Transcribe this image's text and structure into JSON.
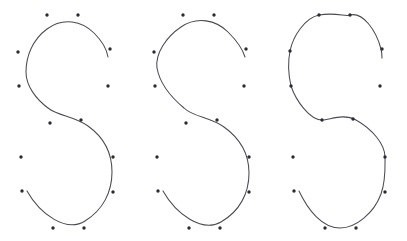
{
  "figure": {
    "title": "",
    "background_color": "#ffffff",
    "width": 407,
    "height": 241,
    "curve_color": "#4a4a52",
    "point_color": "#2b2b33",
    "point_radius": 1.7,
    "stroke_width": 1.05
  },
  "chart_data": {
    "type": "line",
    "title": "",
    "subtitle": "",
    "xlabel": "",
    "ylabel": "",
    "grid": false,
    "legend": "none",
    "xlim": [
      0,
      407
    ],
    "ylim": [
      241,
      0
    ],
    "panels": [
      {
        "name": "panel-1-approximating",
        "label": "approximating",
        "x_offset": 0,
        "control_points": [
          {
            "x": 47,
            "y": 15
          },
          {
            "x": 78,
            "y": 15
          },
          {
            "x": 18,
            "y": 52
          },
          {
            "x": 110,
            "y": 49
          },
          {
            "x": 19,
            "y": 86
          },
          {
            "x": 108,
            "y": 86
          },
          {
            "x": 50,
            "y": 123
          },
          {
            "x": 81,
            "y": 120
          },
          {
            "x": 21,
            "y": 157
          },
          {
            "x": 113,
            "y": 157
          },
          {
            "x": 22,
            "y": 191
          },
          {
            "x": 113,
            "y": 192
          },
          {
            "x": 53,
            "y": 228
          },
          {
            "x": 84,
            "y": 228
          }
        ],
        "path": "M 27 191 C 40 214 66 233 85 221 C 103 210 112 192 112 172 C 112 151 102 136 88 126 C 74 116 58 116 48 108 C 36 99 26 86 26 72 C 26 57 32 40 47 29 C 63 17 82 21 94 33 C 103 42 107 50 108 57"
      },
      {
        "name": "panel-2-intermediate",
        "label": "intermediate",
        "x_offset": 136,
        "control_points": [
          {
            "x": 183,
            "y": 15
          },
          {
            "x": 214,
            "y": 15
          },
          {
            "x": 154,
            "y": 52
          },
          {
            "x": 246,
            "y": 49
          },
          {
            "x": 155,
            "y": 86
          },
          {
            "x": 244,
            "y": 86
          },
          {
            "x": 186,
            "y": 123
          },
          {
            "x": 217,
            "y": 120
          },
          {
            "x": 157,
            "y": 157
          },
          {
            "x": 249,
            "y": 157
          },
          {
            "x": 158,
            "y": 191
          },
          {
            "x": 249,
            "y": 192
          },
          {
            "x": 189,
            "y": 228
          },
          {
            "x": 220,
            "y": 228
          }
        ],
        "path": "M 163 191 C 176 214 202 233 221 222 C 240 211 249 193 249 173 C 249 152 238 137 224 127 C 210 117 193 117 184 108 C 172 98 160 85 157 68 C 155 54 166 37 181 27 C 197 16 216 20 228 32 C 238 42 243 50 245 57"
      },
      {
        "name": "panel-3-interpolating",
        "label": "interpolating",
        "x_offset": 272,
        "control_points": [
          {
            "x": 319,
            "y": 15
          },
          {
            "x": 350,
            "y": 15
          },
          {
            "x": 290,
            "y": 51
          },
          {
            "x": 382,
            "y": 49
          },
          {
            "x": 291,
            "y": 86
          },
          {
            "x": 380,
            "y": 86
          },
          {
            "x": 322,
            "y": 120
          },
          {
            "x": 353,
            "y": 119
          },
          {
            "x": 293,
            "y": 157
          },
          {
            "x": 385,
            "y": 157
          },
          {
            "x": 294,
            "y": 191
          },
          {
            "x": 385,
            "y": 192
          },
          {
            "x": 325,
            "y": 228
          },
          {
            "x": 356,
            "y": 228
          }
        ],
        "path": "M 299 191 C 308 210 322 228 340 228 C 356 228 374 213 381 194 C 386 180 385 168 385 157 C 385 144 372 129 356 120 C 343 113 330 120 322 120 C 310 120 296 101 291 86 C 288 73 288 61 290 51 C 293 36 305 18 319 15 C 336 12 346 17 350 15 C 363 12 376 30 381 49 C 382 53 382 56 382 58"
      }
    ]
  }
}
